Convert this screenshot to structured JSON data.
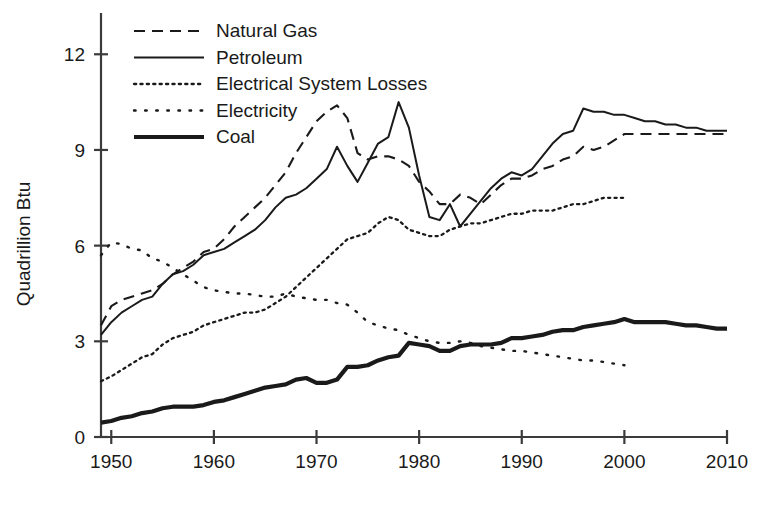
{
  "chart_data": {
    "type": "line",
    "title": "",
    "xlabel": "",
    "ylabel": "Quadrillion Btu",
    "xlim": [
      1949,
      2010
    ],
    "ylim": [
      0,
      13.2
    ],
    "grid": false,
    "legend_position": "top-left",
    "y_ticks": [
      0,
      3,
      6,
      9,
      12
    ],
    "y_tick_labels": [
      "0",
      "3",
      "6",
      "9",
      "12"
    ],
    "x_ticks": [
      1950,
      1960,
      1970,
      1980,
      1990,
      2000,
      2010
    ],
    "x_tick_labels": [
      "1950",
      "1960",
      "1970",
      "1980",
      "1990",
      "2000",
      "2010"
    ],
    "series": [
      {
        "name": "Natural Gas",
        "style": "dashed",
        "x": [
          1949,
          1950,
          1951,
          1952,
          1953,
          1954,
          1955,
          1956,
          1957,
          1958,
          1959,
          1960,
          1961,
          1962,
          1963,
          1964,
          1965,
          1966,
          1967,
          1968,
          1969,
          1970,
          1971,
          1972,
          1973,
          1974,
          1975,
          1976,
          1977,
          1978,
          1979,
          1980,
          1981,
          1982,
          1983,
          1984,
          1985,
          1986,
          1987,
          1988,
          1989,
          1990,
          1991,
          1992,
          1993,
          1994,
          1995,
          1996,
          1997,
          1998,
          1999,
          2000,
          2001,
          2002,
          2003,
          2004,
          2005,
          2006,
          2007,
          2008,
          2009,
          2010
        ],
        "y": [
          3.5,
          4.1,
          4.3,
          4.4,
          4.5,
          4.6,
          4.8,
          5.1,
          5.3,
          5.5,
          5.8,
          5.9,
          6.2,
          6.6,
          6.9,
          7.2,
          7.5,
          7.9,
          8.3,
          8.9,
          9.4,
          9.9,
          10.2,
          10.4,
          10.0,
          8.9,
          8.7,
          8.8,
          8.8,
          8.7,
          8.5,
          8.0,
          7.7,
          7.3,
          7.3,
          7.6,
          7.5,
          7.3,
          7.6,
          7.9,
          8.1,
          8.1,
          8.2,
          8.4,
          8.5,
          8.7,
          8.8,
          9.1,
          9.0,
          9.1,
          9.3,
          9.5,
          9.5,
          9.5,
          9.5,
          9.5,
          9.5,
          9.5,
          9.5,
          9.5,
          9.5,
          9.5
        ]
      },
      {
        "name": "Petroleum",
        "style": "solid",
        "x": [
          1949,
          1950,
          1951,
          1952,
          1953,
          1954,
          1955,
          1956,
          1957,
          1958,
          1959,
          1960,
          1961,
          1962,
          1963,
          1964,
          1965,
          1966,
          1967,
          1968,
          1969,
          1970,
          1971,
          1972,
          1973,
          1974,
          1975,
          1976,
          1977,
          1978,
          1979,
          1980,
          1981,
          1982,
          1983,
          1984,
          1985,
          1986,
          1987,
          1988,
          1989,
          1990,
          1991,
          1992,
          1993,
          1994,
          1995,
          1996,
          1997,
          1998,
          1999,
          2000,
          2001,
          2002,
          2003,
          2004,
          2005,
          2006,
          2007,
          2008,
          2009,
          2010
        ],
        "y": [
          3.2,
          3.6,
          3.9,
          4.1,
          4.3,
          4.4,
          4.8,
          5.1,
          5.2,
          5.4,
          5.7,
          5.8,
          5.9,
          6.1,
          6.3,
          6.5,
          6.8,
          7.2,
          7.5,
          7.6,
          7.8,
          8.1,
          8.4,
          9.1,
          8.5,
          8.0,
          8.6,
          9.2,
          9.4,
          10.5,
          9.7,
          8.2,
          6.9,
          6.8,
          7.3,
          6.6,
          7.0,
          7.4,
          7.8,
          8.1,
          8.3,
          8.2,
          8.4,
          8.8,
          9.2,
          9.5,
          9.6,
          10.3,
          10.2,
          10.2,
          10.1,
          10.1,
          10.0,
          9.9,
          9.9,
          9.8,
          9.8,
          9.7,
          9.7,
          9.6,
          9.6,
          9.6
        ]
      },
      {
        "name": "Electrical System Losses",
        "style": "dotted-fine",
        "x": [
          1949,
          1950,
          1951,
          1952,
          1953,
          1954,
          1955,
          1956,
          1957,
          1958,
          1959,
          1960,
          1961,
          1962,
          1963,
          1964,
          1965,
          1966,
          1967,
          1968,
          1969,
          1970,
          1971,
          1972,
          1973,
          1974,
          1975,
          1976,
          1977,
          1978,
          1979,
          1980,
          1981,
          1982,
          1983,
          1984,
          1985,
          1986,
          1987,
          1988,
          1989,
          1990,
          1991,
          1992,
          1993,
          1994,
          1995,
          1996,
          1997,
          1998,
          1999,
          2000
        ],
        "y": [
          1.75,
          1.9,
          2.1,
          2.3,
          2.5,
          2.6,
          2.9,
          3.1,
          3.2,
          3.3,
          3.5,
          3.6,
          3.7,
          3.8,
          3.9,
          3.9,
          4.0,
          4.2,
          4.4,
          4.7,
          5.0,
          5.3,
          5.6,
          5.9,
          6.2,
          6.3,
          6.4,
          6.7,
          6.9,
          6.8,
          6.5,
          6.4,
          6.3,
          6.3,
          6.5,
          6.6,
          6.7,
          6.7,
          6.8,
          6.9,
          7.0,
          7.0,
          7.1,
          7.1,
          7.1,
          7.2,
          7.3,
          7.3,
          7.4,
          7.5,
          7.5,
          7.5
        ]
      },
      {
        "name": "Electricity",
        "style": "dotted-sparse",
        "x": [
          1949,
          1950,
          1951,
          1952,
          1953,
          1954,
          1955,
          1956,
          1957,
          1958,
          1959,
          1960,
          1961,
          1962,
          1963,
          1964,
          1965,
          1966,
          1967,
          1968,
          1969,
          1970,
          1971,
          1972,
          1973,
          1974,
          1975,
          1976,
          1977,
          1978,
          1979,
          1980,
          1981,
          1982,
          1983,
          1984,
          1985,
          1986,
          1987,
          1988,
          1989,
          1990,
          1991,
          1992,
          1993,
          1994,
          1995,
          1996,
          1997,
          1998,
          1999,
          2000
        ],
        "y": [
          5.7,
          6.1,
          6.05,
          5.9,
          5.85,
          5.6,
          5.5,
          5.3,
          5.1,
          4.9,
          4.7,
          4.6,
          4.55,
          4.5,
          4.5,
          4.45,
          4.4,
          4.4,
          4.5,
          4.4,
          4.35,
          4.3,
          4.3,
          4.2,
          4.15,
          3.9,
          3.6,
          3.5,
          3.4,
          3.35,
          3.2,
          3.1,
          3.0,
          2.95,
          2.95,
          3.0,
          2.95,
          2.85,
          2.8,
          2.75,
          2.7,
          2.7,
          2.65,
          2.6,
          2.55,
          2.5,
          2.45,
          2.4,
          2.4,
          2.35,
          2.3,
          2.25
        ]
      },
      {
        "name": "Coal",
        "style": "solid-thick",
        "x": [
          1949,
          1950,
          1951,
          1952,
          1953,
          1954,
          1955,
          1956,
          1957,
          1958,
          1959,
          1960,
          1961,
          1962,
          1963,
          1964,
          1965,
          1966,
          1967,
          1968,
          1969,
          1970,
          1971,
          1972,
          1973,
          1974,
          1975,
          1976,
          1977,
          1978,
          1979,
          1980,
          1981,
          1982,
          1983,
          1984,
          1985,
          1986,
          1987,
          1988,
          1989,
          1990,
          1991,
          1992,
          1993,
          1994,
          1995,
          1996,
          1997,
          1998,
          1999,
          2000,
          2001,
          2002,
          2003,
          2004,
          2005,
          2006,
          2007,
          2008,
          2009,
          2010
        ],
        "y": [
          0.45,
          0.5,
          0.6,
          0.65,
          0.75,
          0.8,
          0.9,
          0.95,
          0.95,
          0.95,
          1.0,
          1.1,
          1.15,
          1.25,
          1.35,
          1.45,
          1.55,
          1.6,
          1.65,
          1.8,
          1.85,
          1.7,
          1.7,
          1.8,
          2.2,
          2.2,
          2.25,
          2.4,
          2.5,
          2.55,
          2.95,
          2.9,
          2.85,
          2.7,
          2.7,
          2.85,
          2.9,
          2.9,
          2.9,
          2.95,
          3.1,
          3.1,
          3.15,
          3.2,
          3.3,
          3.35,
          3.35,
          3.45,
          3.5,
          3.55,
          3.6,
          3.7,
          3.6,
          3.6,
          3.6,
          3.6,
          3.55,
          3.5,
          3.5,
          3.45,
          3.4,
          3.4
        ]
      }
    ],
    "legend": [
      {
        "label": "Natural Gas",
        "style": "dashed"
      },
      {
        "label": "Petroleum",
        "style": "solid"
      },
      {
        "label": "Electrical System Losses",
        "style": "dotted-fine"
      },
      {
        "label": "Electricity",
        "style": "dotted-sparse"
      },
      {
        "label": "Coal",
        "style": "solid-thick"
      }
    ],
    "colors": {
      "ink": "#1a1a1a",
      "axis": "#3b3b3b",
      "background": "#ffffff"
    }
  }
}
